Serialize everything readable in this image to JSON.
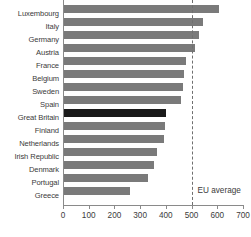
{
  "chart_data": {
    "type": "bar",
    "orientation": "horizontal",
    "title": "",
    "xlabel": "",
    "ylabel": "",
    "xlim": [
      0,
      700
    ],
    "xticks": [
      0,
      100,
      200,
      300,
      400,
      500,
      600,
      700
    ],
    "grid": false,
    "legend": null,
    "categories": [
      "Luxembourg",
      "Italy",
      "Germany",
      "Austria",
      "France",
      "Belgium",
      "Sweden",
      "Spain",
      "Great Britain",
      "Finland",
      "Netherlands",
      "Irish Republic",
      "Denmark",
      "Portugal",
      "Greece"
    ],
    "values": [
      607,
      545,
      530,
      512,
      480,
      470,
      465,
      460,
      400,
      395,
      393,
      365,
      355,
      330,
      262
    ],
    "highlight_category": "Great Britain",
    "annotations": [
      {
        "label": "EU average",
        "type": "vertical-reference-line",
        "value": 500,
        "style": "dashed"
      }
    ],
    "colors": {
      "bar": "#7a7a7a",
      "bar_highlight": "#1a1a1a",
      "axis": "#8a8a8a",
      "text": "#3b3b3b",
      "background": "#ffffff"
    }
  }
}
